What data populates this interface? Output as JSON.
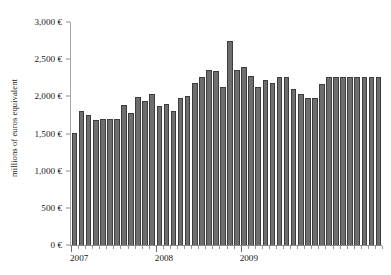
{
  "chart_data": {
    "type": "bar",
    "title": "",
    "subtitle": "",
    "xlabel": "",
    "ylabel": "millions of euros equivalent",
    "ylim": [
      0,
      3000
    ],
    "ytick_labels": [
      "3,000 €",
      "2,500 €",
      "2,000 €",
      "1,500 €",
      "1,000 €",
      "500 €",
      "0 €"
    ],
    "ytick_values": [
      3000,
      2500,
      2000,
      1500,
      1000,
      500,
      0
    ],
    "xtick_labels": [
      "2007",
      "2008",
      "2009"
    ],
    "xtick_positions": [
      0,
      12,
      24
    ],
    "grid": false,
    "legend": null,
    "bar_color": "#6e6e6e",
    "bar_edge_color": "#3d3d3d",
    "axis_color": "#8a8a8a",
    "text_color": "#1a1a1a",
    "background_color": "#ffffff",
    "n_bars": 44,
    "categories": [
      "2007-01",
      "2007-02",
      "2007-03",
      "2007-04",
      "2007-05",
      "2007-06",
      "2007-07",
      "2007-08",
      "2007-09",
      "2007-10",
      "2007-11",
      "2007-12",
      "2008-01",
      "2008-02",
      "2008-03",
      "2008-04",
      "2008-05",
      "2008-06",
      "2008-07",
      "2008-08",
      "2008-09",
      "2008-10",
      "2008-11",
      "2008-12",
      "2009-01",
      "2009-02",
      "2009-03",
      "2009-04",
      "2009-05",
      "2009-06",
      "2009-07",
      "2009-08",
      "2009-09",
      "2009-10",
      "2009-11",
      "2009-12",
      "2010-01",
      "2010-02",
      "2010-03",
      "2010-04",
      "2010-05",
      "2010-06",
      "2010-07",
      "2010-08"
    ],
    "values": [
      1505,
      1800,
      1745,
      1685,
      1700,
      1700,
      1700,
      1885,
      1770,
      1985,
      1940,
      2025,
      1875,
      1895,
      1805,
      1975,
      2000,
      2175,
      2265,
      2350,
      2340,
      2120,
      2745,
      2360,
      2395,
      2275,
      2125,
      2225,
      2185,
      2255,
      2265,
      2095,
      2025,
      1980,
      1980,
      2165,
      2265,
      2265,
      2265,
      2265,
      2265,
      2265,
      2265,
      2265
    ]
  }
}
